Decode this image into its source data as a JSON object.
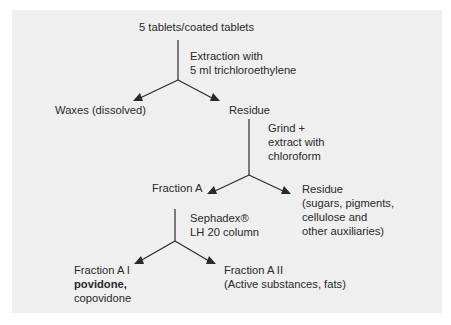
{
  "diagram": {
    "type": "flowchart",
    "nodes": {
      "start": "5 tablets/coated tablets",
      "step1": {
        "line1": "Extraction with",
        "line2": "5 ml trichloroethylene"
      },
      "waxes": "Waxes (dissolved)",
      "residue1": "Residue",
      "step2": {
        "line1": "Grind +",
        "line2": "extract with",
        "line3": "chloroform"
      },
      "fractionA": "Fraction A",
      "residue2": {
        "line1": "Residue",
        "line2": "(sugars, pigments,",
        "line3": "cellulose and",
        "line4": "other auxiliaries)"
      },
      "step3": {
        "line1": "Sephadex®",
        "line2": "LH 20 column"
      },
      "fractionA1": {
        "line1": "Fraction A I",
        "line2": "povidone,",
        "line3": "copovidone"
      },
      "fractionA2": {
        "line1": "Fraction A II",
        "line2": "(Active substances, fats)"
      }
    },
    "edges": [
      {
        "from": "start",
        "to": "waxes",
        "via": "step1"
      },
      {
        "from": "start",
        "to": "residue1",
        "via": "step1"
      },
      {
        "from": "residue1",
        "to": "fractionA",
        "via": "step2"
      },
      {
        "from": "residue1",
        "to": "residue2",
        "via": "step2"
      },
      {
        "from": "fractionA",
        "to": "fractionA1",
        "via": "step3"
      },
      {
        "from": "fractionA",
        "to": "fractionA2",
        "via": "step3"
      }
    ],
    "colors": {
      "background": "#efefef",
      "line": "#2a2a2a",
      "text": "#2a2a2a"
    }
  }
}
